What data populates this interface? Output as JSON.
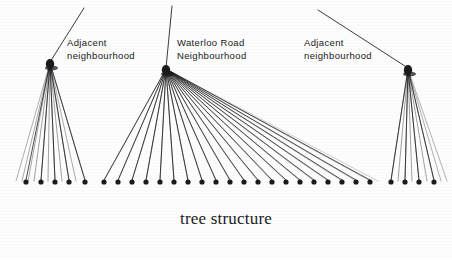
{
  "figure": {
    "caption": "tree structure",
    "ink_color": "#1b1b1d",
    "background_color": "#fdfdfd"
  },
  "groups": [
    {
      "id": "left-adjacent",
      "label_line1": "Adjacent",
      "label_line2": "neighbourhood",
      "apex": {
        "x": 50,
        "y": 62
      },
      "trunk_end": {
        "x": 84,
        "y": 8
      },
      "leaf_y": 182,
      "leaves_x": [
        26,
        41,
        55,
        69,
        85
      ],
      "branch_tips_x": [
        16,
        22,
        28,
        34,
        41,
        48,
        55,
        62,
        69,
        76,
        85
      ]
    },
    {
      "id": "middle-waterloo",
      "label_line1": "Waterloo Road",
      "label_line2": "Neighbourhood",
      "apex": {
        "x": 166,
        "y": 68
      },
      "trunk_end": {
        "x": 172,
        "y": 6
      },
      "leaf_y": 182,
      "leaves_x": [
        104,
        118,
        132,
        146,
        160,
        174,
        188,
        202,
        216,
        230,
        244,
        258,
        272,
        286,
        300,
        314,
        328,
        342,
        356,
        370
      ],
      "branch_tips_x": [
        104,
        118,
        132,
        146,
        160,
        174,
        188,
        202,
        216,
        230,
        244,
        258,
        272,
        286,
        300,
        314,
        328,
        342,
        356,
        370,
        378
      ]
    },
    {
      "id": "right-adjacent",
      "label_line1": "Adjacent",
      "label_line2": "neighbourhood",
      "apex": {
        "x": 408,
        "y": 68
      },
      "trunk_end": {
        "x": 318,
        "y": 10
      },
      "leaf_y": 182,
      "leaves_x": [
        391,
        405,
        419,
        434
      ],
      "branch_tips_x": [
        391,
        398,
        405,
        412,
        419,
        427,
        434,
        441,
        447
      ]
    }
  ]
}
